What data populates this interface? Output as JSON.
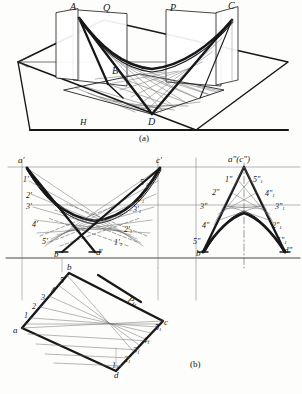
{
  "figure": {
    "title_caption_a": "(a)",
    "title_caption_b": "(b)",
    "surface_type": "hyperbolic paraboloid (saddle) ruled surface",
    "colors": {
      "ink": "#17171a",
      "thin_line": "#6d6d70",
      "paper": "#fdfdfb",
      "faint": "#b9b4ad"
    }
  },
  "view_a": {
    "name": "pictorial-axonometric-view",
    "labels": {
      "A": "A",
      "Q": "Q",
      "P": "P",
      "C": "C",
      "B": "B",
      "D": "D",
      "H": "H"
    },
    "caption": "(a)"
  },
  "view_front": {
    "name": "front-elevation-view",
    "labels": {
      "a": "a'",
      "c": "c'",
      "b": "b'",
      "d": "d'",
      "left_gen": [
        "1'",
        "2'",
        "3'",
        "4'",
        "5'"
      ],
      "right_gen": [
        "5'",
        "4'",
        "3'",
        "2'",
        "1'"
      ],
      "right_gen_sub": "1"
    }
  },
  "view_side": {
    "name": "side-profile-view",
    "labels": {
      "ac": "a\"(c\")",
      "b": "b\"",
      "d": "d\"",
      "left_gen": [
        "1\"",
        "2\"",
        "3\"",
        "4\"",
        "5\""
      ],
      "right_gen": [
        "5\"",
        "4\"",
        "3\"",
        "2\"",
        "1\""
      ],
      "right_gen_sub": "1"
    }
  },
  "view_plan": {
    "name": "plan-top-view",
    "labels": {
      "a": "a",
      "b": "b",
      "c": "c",
      "d": "d",
      "left_gen": [
        "1",
        "2",
        "3",
        "4",
        "5"
      ],
      "right_gen": [
        "5",
        "4",
        "3",
        "2",
        "1"
      ],
      "right_gen_sub": "1",
      "plane_trace": "P",
      "plane_trace_sub": "H"
    },
    "caption": "(b)"
  }
}
